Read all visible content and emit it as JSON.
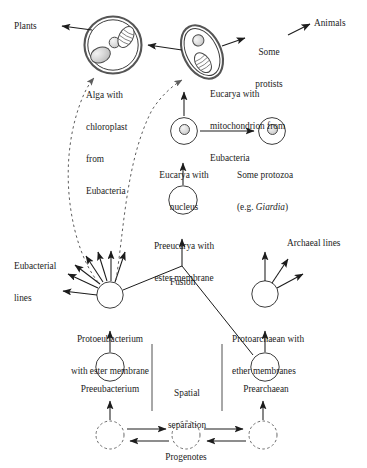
{
  "figure": {
    "type": "biology-concept-diagram"
  },
  "labels": {
    "plants": "Plants",
    "animals": "Animals",
    "some_protists_l1": "Some",
    "some_protists_l2": "protists",
    "alga_l1": "Alga with",
    "alga_l2": "chloroplast",
    "alga_l3": "from",
    "alga_l4": "Eubacteria",
    "eucarya_mito_l1": "Eucarya with",
    "eucarya_mito_l2": "mitochondrion from",
    "eucarya_mito_l3": "Eubacteria",
    "eucarya_nucleus_l1": "Eucarya with",
    "eucarya_nucleus_l2": "nucleus",
    "protozoa_l1": "Some protozoa",
    "protozoa_l2_prefix": "(e.g. ",
    "protozoa_l2_italic": "Giardia",
    "protozoa_l2_suffix": ")",
    "preeucarya_l1": "Preeucarya with",
    "preeucarya_l2": "ester membrane",
    "eubacterial_lines_l1": "Eubacterial",
    "eubacterial_lines_l2": "lines",
    "archaeal_lines": "Archaeal lines",
    "fusion": "Fusion",
    "protoeubacterium_l1": "Protoeubacterium",
    "protoeubacterium_l2": "with ester membrane",
    "protoarchaean_l1": "Protoarchaean with",
    "protoarchaean_l2": "ether membranes",
    "preeubacterium": "Preeubacterium",
    "prearchaean": "Prearchaean",
    "spatial_sep_l1": "Spatial",
    "spatial_sep_l2": "separation",
    "progenotes": "Progenotes"
  },
  "colors": {
    "stroke": "#1c1c1c",
    "membrane_outer": "#4a4a4a",
    "organelle_fill": "#d9d9d9",
    "cell_fill": "#ffffff",
    "dashed": "#6b6b6b",
    "text": "#1c1c1c"
  },
  "nodes": [
    {
      "id": "alga",
      "label": "Alga with chloroplast from Eubacteria",
      "shape": "circle-double-membrane",
      "cx": 113,
      "cy": 45,
      "r": 28,
      "organelles": [
        "chloroplast",
        "nucleus",
        "mitochondrion"
      ]
    },
    {
      "id": "eucarya-mito",
      "label": "Eucarya with mitochondrion from Eubacteria",
      "shape": "ellipse-double-membrane",
      "cx": 202,
      "cy": 52,
      "rx": 17,
      "ry": 27,
      "rotation": -28,
      "organelles": [
        "nucleus",
        "mitochondrion"
      ]
    },
    {
      "id": "eucarya-nucleus",
      "label": "Eucarya with nucleus",
      "shape": "circle",
      "cx": 184,
      "cy": 131,
      "r": 13,
      "organelles": [
        "nucleus"
      ]
    },
    {
      "id": "protozoa",
      "label": "Some protozoa (e.g. Giardia)",
      "shape": "circle",
      "cx": 272,
      "cy": 131,
      "r": 13,
      "organelles": [
        "nucleus"
      ]
    },
    {
      "id": "preeucarya",
      "label": "Preeucarya with ester membrane",
      "shape": "circle",
      "cx": 183,
      "cy": 200,
      "r": 14,
      "organelles": []
    },
    {
      "id": "protoeubacterium",
      "label": "Protoeubacterium with ester membrane",
      "shape": "circle",
      "cx": 110,
      "cy": 295,
      "r": 13,
      "organelles": []
    },
    {
      "id": "protoarchaean",
      "label": "Protoarchaean with ether membranes",
      "shape": "circle",
      "cx": 265,
      "cy": 294,
      "r": 13,
      "organelles": []
    },
    {
      "id": "preeubacterium",
      "label": "Preeubacterium",
      "shape": "circle",
      "cx": 110,
      "cy": 367,
      "r": 14,
      "organelles": []
    },
    {
      "id": "prearchaean",
      "label": "Prearchaean",
      "shape": "circle",
      "cx": 265,
      "cy": 367,
      "r": 14,
      "organelles": []
    },
    {
      "id": "progenote-left",
      "label": "Progenotes",
      "shape": "circle-dashed",
      "cx": 110,
      "cy": 435,
      "r": 14,
      "organelles": []
    },
    {
      "id": "progenote-center",
      "label": "Progenotes",
      "shape": "circle-dashed",
      "cx": 186,
      "cy": 435,
      "r": 14,
      "organelles": []
    },
    {
      "id": "progenote-right",
      "label": "Progenotes",
      "shape": "circle-dashed",
      "cx": 263,
      "cy": 435,
      "r": 14,
      "organelles": []
    }
  ],
  "edges": [
    {
      "from": "alga",
      "to": "plants",
      "style": "solid-arrow"
    },
    {
      "from": "eucarya-mito",
      "to": "alga",
      "style": "solid-arrow"
    },
    {
      "from": "eucarya-mito",
      "to": "some-protists",
      "style": "solid-arrow"
    },
    {
      "from": "some-protists",
      "to": "animals",
      "style": "solid-arrow"
    },
    {
      "from": "eucarya-nucleus",
      "to": "eucarya-mito",
      "style": "solid-arrow"
    },
    {
      "from": "eucarya-nucleus",
      "to": "protozoa",
      "style": "solid-arrow"
    },
    {
      "from": "preeucarya",
      "to": "eucarya-nucleus",
      "style": "solid-arrow"
    },
    {
      "from": "fusion-vertex",
      "to": "preeucarya",
      "style": "solid-arrow"
    },
    {
      "from": "protoeubacterium",
      "to": "fusion-vertex",
      "style": "solid-line"
    },
    {
      "from": "protoarchaean-base",
      "to": "fusion-vertex",
      "style": "solid-line"
    },
    {
      "from": "preeubacterium",
      "to": "protoeubacterium",
      "style": "solid-arrow"
    },
    {
      "from": "prearchaean",
      "to": "protoarchaean",
      "style": "solid-arrow"
    },
    {
      "from": "progenote-left",
      "to": "preeubacterium",
      "style": "solid-arrow"
    },
    {
      "from": "progenote-right",
      "to": "prearchaean",
      "style": "solid-arrow"
    },
    {
      "from": "progenote-left",
      "to": "progenote-center",
      "style": "solid-arrow-bidirectional"
    },
    {
      "from": "progenote-center",
      "to": "progenote-right",
      "style": "solid-arrow-bidirectional"
    },
    {
      "from": "protoeubacterium",
      "to": "alga-chloroplast",
      "style": "dashed-arrow"
    },
    {
      "from": "protoeubacterium",
      "to": "eucarya-mito-mitochondrion",
      "style": "dashed-arrow"
    },
    {
      "from": "protoeubacterium",
      "to": "eubacterial-lines",
      "style": "radiating-arrows",
      "count": 7
    },
    {
      "from": "protoarchaean",
      "to": "archaeal-lines",
      "style": "radiating-arrows",
      "count": 3
    }
  ]
}
